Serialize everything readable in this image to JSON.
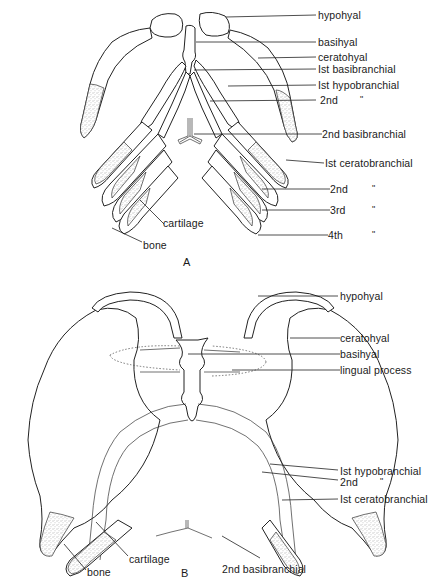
{
  "figure_A": {
    "panel_label": "A",
    "labels": {
      "hypohyal": "hypohyal",
      "basihyal": "basihyal",
      "ceratohyal": "ceratohyal",
      "first_basibranchial": "Ist basibranchial",
      "first_hypobranchial": "Ist hypobranchial",
      "second_hypobranchial": "2nd",
      "second_basibranchial": "2nd basibranchial",
      "first_ceratobranchial": "Ist ceratobranchial",
      "second_ceratobranchial": "2nd",
      "third_ceratobranchial": "3rd",
      "fourth_ceratobranchial": "4th",
      "cartilage": "cartilage",
      "bone": "bone"
    },
    "ditto_mark": "\""
  },
  "figure_B": {
    "panel_label": "B",
    "labels": {
      "hypohyal": "hypohyal",
      "ceratohyal": "ceratohyal",
      "basihyal": "basihyal",
      "lingual_process": "lingual process",
      "first_hypobranchial": "Ist hypobranchial",
      "second_hypobranchial": "2nd",
      "first_ceratobranchial": "Ist ceratobranchial",
      "second_basibranchial": "2nd basibranchial",
      "cartilage": "cartilage",
      "bone": "bone"
    },
    "ditto_mark": "\""
  }
}
